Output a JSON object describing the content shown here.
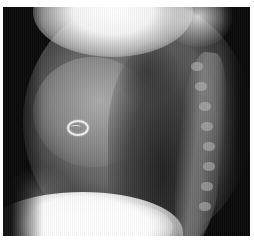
{
  "image": {
    "type": "radiograph",
    "view": "lateral chest",
    "description": "Lateral chest X-ray showing a ring-shaped radiopaque object over the cardiac silhouette, vertebral column on the right, and diaphragm at the bottom",
    "features": [
      {
        "name": "ring-object",
        "position": "center-left",
        "shape": "oval ring"
      },
      {
        "name": "spine",
        "position": "right"
      },
      {
        "name": "diaphragm",
        "position": "bottom-left"
      },
      {
        "name": "lung-field",
        "position": "right-center"
      }
    ],
    "colors": {
      "background": "#0a0a0a",
      "bright": "#ffffff",
      "border": "#ffffff"
    }
  }
}
